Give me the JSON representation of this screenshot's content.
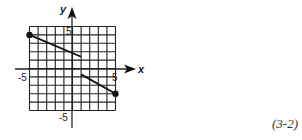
{
  "figure_label": "(3-2)",
  "chart_data": {
    "type": "line",
    "title": "",
    "xlabel": "x",
    "ylabel": "y",
    "xlim": [
      -5,
      5
    ],
    "ylim": [
      -5,
      5
    ],
    "grid": true,
    "tick_labels": {
      "x": [
        "-5",
        "5"
      ],
      "y": [
        "5",
        "-5"
      ]
    },
    "series": [
      {
        "name": "segment-1",
        "points": [
          [
            -5,
            4
          ],
          [
            1,
            1.4
          ]
        ],
        "start_marker": "filled-dot",
        "end_marker": "none"
      },
      {
        "name": "segment-2",
        "points": [
          [
            1,
            -0.7
          ],
          [
            5,
            -3
          ]
        ],
        "start_marker": "none",
        "end_marker": "filled-dot"
      }
    ]
  }
}
